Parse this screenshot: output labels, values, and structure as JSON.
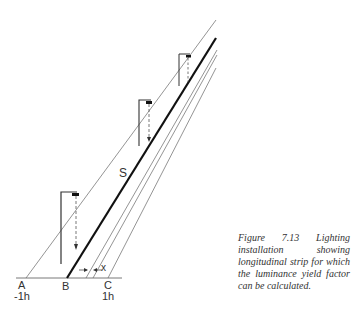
{
  "figure": {
    "caption": "Figure 7.13 Lighting installation showing longitudinal strip for which the luminance yield factor can be calculated.",
    "labels": {
      "A": "A",
      "A_sub": "-1h",
      "B": "B",
      "C": "C",
      "C_sub": "1h",
      "S": "S",
      "x": "x"
    },
    "luminaires": 3,
    "colors": {
      "line": "#555555",
      "road_edge": "#111111",
      "dashed": "#555555"
    }
  }
}
